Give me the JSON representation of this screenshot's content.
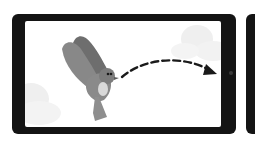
{
  "illustration": {
    "subject": "bird flying across tablet screen",
    "elements": {
      "device": "tablet-landscape",
      "character": "bird",
      "motion": "dashed-arrow-right",
      "background": "clouds",
      "adjacent_device": "tablet-partial"
    },
    "colors": {
      "bezel": "#141414",
      "screen": "#ffffff",
      "bird_wing": "#7a7a7a",
      "bird_body": "#8c8c8c",
      "bird_belly": "#d9d9d9",
      "arrow": "#1a1a1a",
      "cloud": "#efefef"
    }
  }
}
